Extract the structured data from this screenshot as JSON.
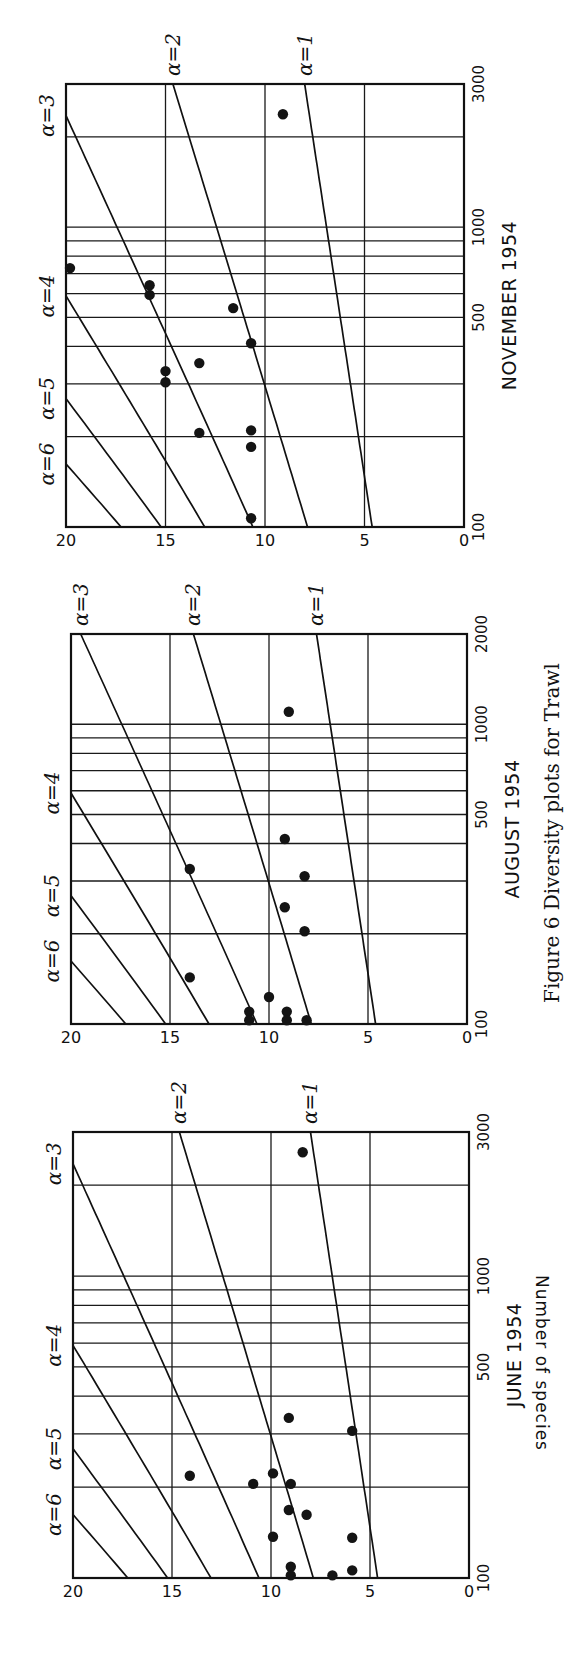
{
  "figure": {
    "caption": "Figure 6 Diversity plots for Trawl"
  },
  "chart_data": [
    {
      "type": "scatter",
      "title": "JUNE 1954",
      "xlabel": "",
      "ylabel": "Number of species",
      "x_scale": "log",
      "xlim": [
        100,
        3000
      ],
      "ylim": [
        0,
        20
      ],
      "x_ticks": [
        100,
        500,
        1000,
        3000
      ],
      "x_tick_labels": [
        "100",
        "500",
        "1000",
        "3000"
      ],
      "x_minor_gridlines": [
        200,
        300,
        400,
        500,
        600,
        700,
        800,
        900,
        1000,
        2000
      ],
      "y_ticks": [
        0,
        5,
        10,
        15,
        20
      ],
      "y_tick_labels": [
        "0",
        "5",
        "10",
        "15",
        "20"
      ],
      "grid": true,
      "alpha_curves": [
        1,
        2,
        3,
        4,
        5,
        6
      ],
      "alpha_labels": [
        "α=1",
        "α=2",
        "α=3",
        "α=4",
        "α=5",
        "α=6"
      ],
      "points": [
        {
          "x": 2570,
          "y": 8.4
        },
        {
          "x": 339,
          "y": 9.1
        },
        {
          "x": 307,
          "y": 5.9
        },
        {
          "x": 218,
          "y": 14.1
        },
        {
          "x": 222,
          "y": 9.9
        },
        {
          "x": 205,
          "y": 10.9
        },
        {
          "x": 205,
          "y": 9.0
        },
        {
          "x": 168,
          "y": 9.1
        },
        {
          "x": 162,
          "y": 8.2
        },
        {
          "x": 137,
          "y": 9.9
        },
        {
          "x": 136,
          "y": 5.9
        },
        {
          "x": 109,
          "y": 9.0
        },
        {
          "x": 106,
          "y": 5.9
        },
        {
          "x": 102,
          "y": 6.9
        },
        {
          "x": 102,
          "y": 9.0
        }
      ]
    },
    {
      "type": "scatter",
      "title": "AUGUST 1954",
      "xlabel": "",
      "ylabel": "",
      "x_scale": "log",
      "xlim": [
        100,
        2000
      ],
      "ylim": [
        0,
        20
      ],
      "x_ticks": [
        100,
        500,
        1000,
        2000
      ],
      "x_tick_labels": [
        "100",
        "500",
        "1000",
        "2000"
      ],
      "x_minor_gridlines": [
        200,
        300,
        400,
        500,
        600,
        700,
        800,
        900,
        1000
      ],
      "y_ticks": [
        0,
        5,
        10,
        15,
        20
      ],
      "y_tick_labels": [
        "0",
        "5",
        "10",
        "15",
        "20"
      ],
      "grid": true,
      "alpha_curves": [
        1,
        2,
        3,
        4,
        5,
        6
      ],
      "alpha_labels": [
        "α=1",
        "α=2",
        "α=3",
        "α=4",
        "α=5",
        "α=6"
      ],
      "points": [
        {
          "x": 1100,
          "y": 9.0
        },
        {
          "x": 414,
          "y": 9.2
        },
        {
          "x": 329,
          "y": 14.0
        },
        {
          "x": 311,
          "y": 8.2
        },
        {
          "x": 245,
          "y": 9.2
        },
        {
          "x": 204,
          "y": 8.2
        },
        {
          "x": 143,
          "y": 14.0
        },
        {
          "x": 123,
          "y": 10.0
        },
        {
          "x": 110,
          "y": 11.0
        },
        {
          "x": 103,
          "y": 11.0
        },
        {
          "x": 110,
          "y": 9.1
        },
        {
          "x": 103,
          "y": 9.1
        },
        {
          "x": 103,
          "y": 8.1
        }
      ]
    },
    {
      "type": "scatter",
      "title": "NOVEMBER 1954",
      "xlabel": "",
      "ylabel": "",
      "x_scale": "log",
      "xlim": [
        100,
        3000
      ],
      "ylim": [
        0,
        20
      ],
      "x_ticks": [
        100,
        500,
        1000,
        3000
      ],
      "x_tick_labels": [
        "100",
        "500",
        "1000",
        "3000"
      ],
      "x_minor_gridlines": [
        200,
        300,
        400,
        500,
        600,
        700,
        800,
        900,
        1000,
        2000
      ],
      "y_ticks": [
        0,
        5,
        10,
        15,
        20
      ],
      "y_tick_labels": [
        "0",
        "5",
        "10",
        "15",
        "20"
      ],
      "grid": true,
      "alpha_curves": [
        1,
        2,
        3,
        4,
        5,
        6
      ],
      "alpha_labels": [
        "α=1",
        "α=2",
        "α=3",
        "α=4",
        "α=5",
        "α=6"
      ],
      "points": [
        {
          "x": 2380,
          "y": 9.1
        },
        {
          "x": 730,
          "y": 19.8
        },
        {
          "x": 640,
          "y": 15.8
        },
        {
          "x": 594,
          "y": 15.8
        },
        {
          "x": 537,
          "y": 11.6
        },
        {
          "x": 410,
          "y": 10.7
        },
        {
          "x": 352,
          "y": 13.3
        },
        {
          "x": 331,
          "y": 15.0
        },
        {
          "x": 304,
          "y": 15.0
        },
        {
          "x": 210,
          "y": 10.7
        },
        {
          "x": 206,
          "y": 13.3
        },
        {
          "x": 185,
          "y": 10.7
        },
        {
          "x": 107,
          "y": 10.7
        }
      ]
    }
  ]
}
